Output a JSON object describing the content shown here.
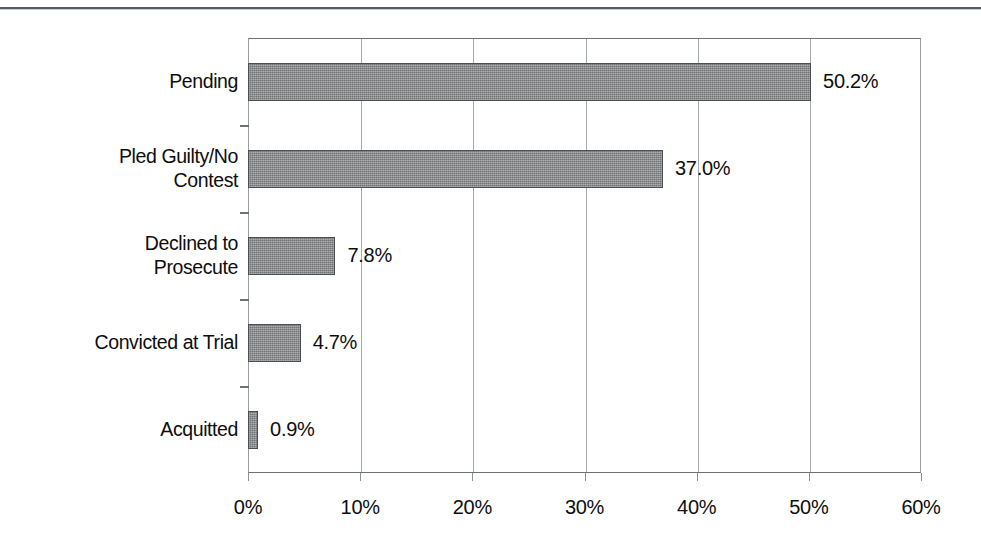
{
  "chart_data": {
    "type": "bar",
    "orientation": "horizontal",
    "title": "",
    "subtitle": "",
    "xlabel": "",
    "ylabel": "",
    "categories": [
      "Pending",
      "Pled Guilty/No\nContest",
      "Declined to\nProsecute",
      "Convicted at Trial",
      "Acquitted"
    ],
    "values": [
      50.2,
      37.0,
      7.8,
      4.7,
      0.9
    ],
    "data_labels": [
      "50.2%",
      "37.0%",
      "7.8%",
      "4.7%",
      "0.9%"
    ],
    "xlim": [
      0,
      60
    ],
    "xticks": [
      0,
      10,
      20,
      30,
      40,
      50,
      60
    ],
    "xtick_labels": [
      "0%",
      "10%",
      "20%",
      "30%",
      "40%",
      "50%",
      "60%"
    ],
    "grid": true,
    "grid_axis": "x",
    "legend": false,
    "legend_position": "none",
    "value_unit": "percent"
  },
  "style": {
    "bar_fill": "#8b8d8f",
    "bar_border": "#4c4f52",
    "grid_color": "#a8abae",
    "axis_color": "#6e7276",
    "text_color": "#0d0d0d",
    "background": "#ffffff",
    "rule_color": "#555a5e"
  }
}
